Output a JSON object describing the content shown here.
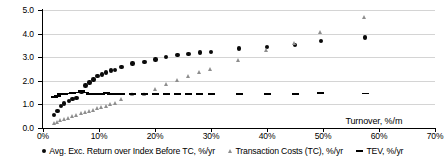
{
  "chart_data": {
    "type": "scatter",
    "title": "",
    "xlabel": "Turnover, %/m",
    "ylabel": "",
    "xlim": [
      0,
      70
    ],
    "ylim": [
      0,
      5
    ],
    "grid": true,
    "legend_position": "bottom",
    "xticks": [
      "0%",
      "10%",
      "20%",
      "30%",
      "40%",
      "50%",
      "60%",
      "70%"
    ],
    "xtick_values": [
      0,
      10,
      20,
      30,
      40,
      50,
      60,
      70
    ],
    "yticks": [
      "0.0",
      "1.0",
      "2.0",
      "3.0",
      "4.0",
      "5.0"
    ],
    "ytick_values": [
      0,
      1,
      2,
      3,
      4,
      5
    ],
    "series": [
      {
        "name": "Avg. Exc. Return over Index Before TC, %/yr",
        "marker": "circle",
        "color": "#0a0a0a",
        "points": [
          [
            2.0,
            0.55
          ],
          [
            2.6,
            0.72
          ],
          [
            3.2,
            0.92
          ],
          [
            3.8,
            1.04
          ],
          [
            4.6,
            1.14
          ],
          [
            5.3,
            1.23
          ],
          [
            6.0,
            1.28
          ],
          [
            6.9,
            1.52
          ],
          [
            7.6,
            1.8
          ],
          [
            8.3,
            1.93
          ],
          [
            9.0,
            2.05
          ],
          [
            9.7,
            2.2
          ],
          [
            10.5,
            2.26
          ],
          [
            11.3,
            2.35
          ],
          [
            12.1,
            2.44
          ],
          [
            12.9,
            2.46
          ],
          [
            14.0,
            2.58
          ],
          [
            16.0,
            2.74
          ],
          [
            18.1,
            2.8
          ],
          [
            20.1,
            2.91
          ],
          [
            22.0,
            3.02
          ],
          [
            24.0,
            3.09
          ],
          [
            26.0,
            3.14
          ],
          [
            28.0,
            3.2
          ],
          [
            30.0,
            3.23
          ],
          [
            35.0,
            3.37
          ],
          [
            40.0,
            3.44
          ],
          [
            45.0,
            3.53
          ],
          [
            49.6,
            3.68
          ],
          [
            57.5,
            3.83
          ]
        ]
      },
      {
        "name": "Transaction Costs (TC), %/yr",
        "marker": "triangle",
        "color": "#8e8e8e",
        "points": [
          [
            2.0,
            0.18
          ],
          [
            2.6,
            0.24
          ],
          [
            3.2,
            0.3
          ],
          [
            3.8,
            0.36
          ],
          [
            4.6,
            0.42
          ],
          [
            5.3,
            0.48
          ],
          [
            6.0,
            0.54
          ],
          [
            6.9,
            0.6
          ],
          [
            7.6,
            0.66
          ],
          [
            8.3,
            0.72
          ],
          [
            9.0,
            0.76
          ],
          [
            9.7,
            0.82
          ],
          [
            10.5,
            0.86
          ],
          [
            11.3,
            0.92
          ],
          [
            12.1,
            0.98
          ],
          [
            12.9,
            1.05
          ],
          [
            14.0,
            1.2
          ],
          [
            16.0,
            1.42
          ],
          [
            18.1,
            1.44
          ],
          [
            20.1,
            1.65
          ],
          [
            22.0,
            1.86
          ],
          [
            24.0,
            2.02
          ],
          [
            26.0,
            2.18
          ],
          [
            28.0,
            2.34
          ],
          [
            30.0,
            2.48
          ],
          [
            35.0,
            2.88
          ],
          [
            40.0,
            3.3
          ],
          [
            45.0,
            3.56
          ],
          [
            49.6,
            4.06
          ],
          [
            57.5,
            4.68
          ]
        ]
      },
      {
        "name": "TEV, %/yr",
        "marker": "dash",
        "color": "#000000",
        "points": [
          [
            2.0,
            1.33
          ],
          [
            2.6,
            1.35
          ],
          [
            3.2,
            1.42
          ],
          [
            3.8,
            1.44
          ],
          [
            4.6,
            1.46
          ],
          [
            5.3,
            1.48
          ],
          [
            6.0,
            1.5
          ],
          [
            6.9,
            1.55
          ],
          [
            7.6,
            1.5
          ],
          [
            8.3,
            1.45
          ],
          [
            9.0,
            1.45
          ],
          [
            9.7,
            1.45
          ],
          [
            10.5,
            1.44
          ],
          [
            11.3,
            1.47
          ],
          [
            12.1,
            1.42
          ],
          [
            12.9,
            1.42
          ],
          [
            14.0,
            1.44
          ],
          [
            16.0,
            1.43
          ],
          [
            18.1,
            1.43
          ],
          [
            20.1,
            1.43
          ],
          [
            22.0,
            1.42
          ],
          [
            24.0,
            1.42
          ],
          [
            26.0,
            1.42
          ],
          [
            28.0,
            1.42
          ],
          [
            30.0,
            1.42
          ],
          [
            35.0,
            1.42
          ],
          [
            40.0,
            1.43
          ],
          [
            45.0,
            1.42
          ],
          [
            49.6,
            1.47
          ],
          [
            57.5,
            1.46
          ]
        ]
      }
    ]
  }
}
